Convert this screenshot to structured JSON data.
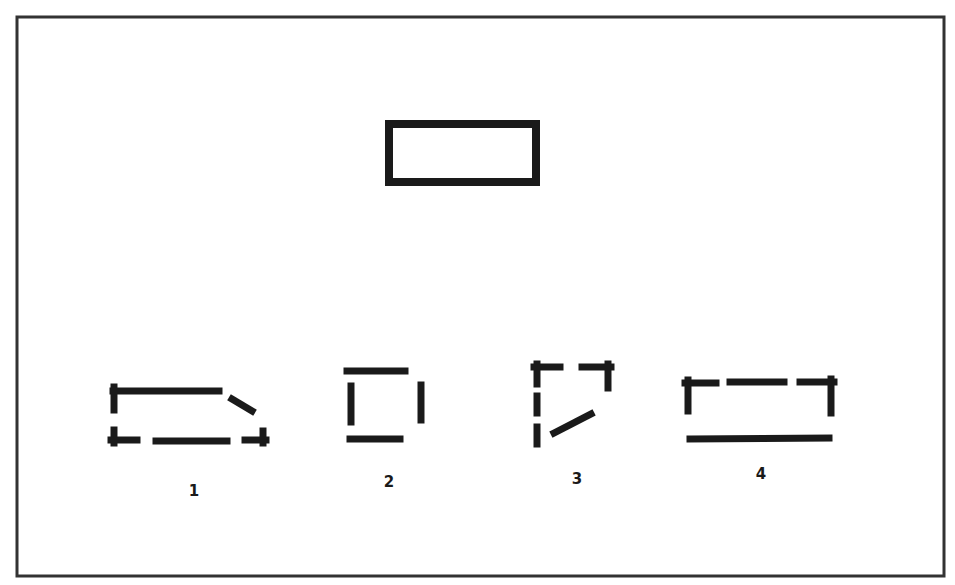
{
  "figure": {
    "frame": {
      "x": 17,
      "y": 17,
      "width": 927,
      "height": 559,
      "color": "#333333",
      "stroke_width": 3
    },
    "ink_color": "#1a1a1a",
    "target_shape": {
      "name": "closed-rectangle",
      "description": "Solid closed rectangle (reference figure)",
      "x": 389,
      "y": 124,
      "width": 147,
      "height": 58,
      "stroke_width": 8
    },
    "options": [
      {
        "label": "1",
        "description": "Fragmented pentagon-like shape with slanted right corner",
        "label_pos": {
          "x": 194,
          "y": 496
        },
        "segments": [
          {
            "x1": 113,
            "y1": 391,
            "x2": 219,
            "y2": 391
          },
          {
            "x1": 114,
            "y1": 387,
            "x2": 114,
            "y2": 410
          },
          {
            "x1": 232,
            "y1": 399,
            "x2": 252,
            "y2": 411
          },
          {
            "x1": 114,
            "y1": 430,
            "x2": 114,
            "y2": 443
          },
          {
            "x1": 111,
            "y1": 440,
            "x2": 137,
            "y2": 440
          },
          {
            "x1": 156,
            "y1": 441,
            "x2": 227,
            "y2": 441
          },
          {
            "x1": 245,
            "y1": 440,
            "x2": 266,
            "y2": 440
          },
          {
            "x1": 263,
            "y1": 431,
            "x2": 263,
            "y2": 443
          }
        ]
      },
      {
        "label": "2",
        "description": "Four separated sides forming a square",
        "label_pos": {
          "x": 389,
          "y": 487
        },
        "segments": [
          {
            "x1": 347,
            "y1": 371,
            "x2": 405,
            "y2": 371
          },
          {
            "x1": 351,
            "y1": 386,
            "x2": 351,
            "y2": 422
          },
          {
            "x1": 421,
            "y1": 385,
            "x2": 421,
            "y2": 420
          },
          {
            "x1": 350,
            "y1": 439,
            "x2": 400,
            "y2": 439
          }
        ]
      },
      {
        "label": "3",
        "description": "Corner brackets with dashed left side and diagonal stroke",
        "label_pos": {
          "x": 577,
          "y": 484
        },
        "segments": [
          {
            "x1": 534,
            "y1": 367,
            "x2": 560,
            "y2": 367
          },
          {
            "x1": 537,
            "y1": 364,
            "x2": 537,
            "y2": 384
          },
          {
            "x1": 582,
            "y1": 367,
            "x2": 611,
            "y2": 367
          },
          {
            "x1": 608,
            "y1": 364,
            "x2": 608,
            "y2": 388
          },
          {
            "x1": 537,
            "y1": 396,
            "x2": 537,
            "y2": 413
          },
          {
            "x1": 537,
            "y1": 427,
            "x2": 537,
            "y2": 444
          },
          {
            "x1": 554,
            "y1": 433,
            "x2": 591,
            "y2": 414
          }
        ]
      },
      {
        "label": "4",
        "description": "Open-bottom bracket top with separate bottom line",
        "label_pos": {
          "x": 761,
          "y": 479
        },
        "segments": [
          {
            "x1": 685,
            "y1": 383,
            "x2": 716,
            "y2": 383
          },
          {
            "x1": 688,
            "y1": 380,
            "x2": 688,
            "y2": 411
          },
          {
            "x1": 730,
            "y1": 382,
            "x2": 784,
            "y2": 382
          },
          {
            "x1": 800,
            "y1": 382,
            "x2": 834,
            "y2": 382
          },
          {
            "x1": 831,
            "y1": 379,
            "x2": 831,
            "y2": 413
          },
          {
            "x1": 690,
            "y1": 439,
            "x2": 829,
            "y2": 438
          }
        ]
      }
    ],
    "segment_stroke_width": 7
  }
}
